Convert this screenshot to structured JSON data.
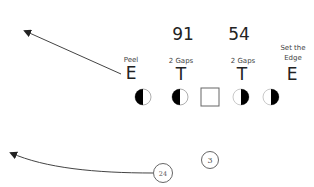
{
  "title_numbers": [
    {
      "id": "left-tackle-number",
      "text": "91"
    },
    {
      "id": "right-tackle-number",
      "text": "54"
    }
  ],
  "defenders": [
    {
      "id": "left-end",
      "letter": "E",
      "assignment": [
        "Peel"
      ]
    },
    {
      "id": "left-tackle",
      "letter": "T",
      "assignment": [
        "2 Gaps"
      ]
    },
    {
      "id": "right-tackle",
      "letter": "T",
      "assignment": [
        "2 Gaps"
      ]
    },
    {
      "id": "right-end",
      "letter": "E",
      "assignment": [
        "Set the",
        "Edge"
      ]
    }
  ],
  "offensive_line": [
    {
      "id": "left-tackle-ol",
      "shape": "half-circle",
      "filled_side": "left"
    },
    {
      "id": "left-guard-ol",
      "shape": "half-circle",
      "filled_side": "left"
    },
    {
      "id": "center-ol",
      "shape": "square"
    },
    {
      "id": "right-guard-ol",
      "shape": "half-circle",
      "filled_side": "right"
    },
    {
      "id": "right-tackle-ol",
      "shape": "half-circle",
      "filled_side": "right"
    }
  ],
  "backs": [
    {
      "id": "running-back",
      "label": "24"
    },
    {
      "id": "quarterback",
      "label": "3"
    }
  ],
  "routes": [
    {
      "id": "peel-route",
      "from": "left-end",
      "direction": "up-left"
    },
    {
      "id": "running-back-route",
      "from": "running-back",
      "direction": "left"
    }
  ],
  "colors": {
    "line": "#444444",
    "fill": "#000000",
    "stroke": "#555555"
  }
}
